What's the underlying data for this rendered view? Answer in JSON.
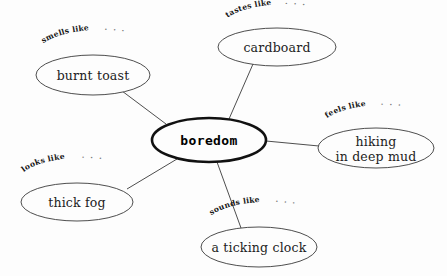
{
  "diagram": {
    "type": "sensory-detail-web",
    "background_color": "#fdfdfd",
    "ink_color": "#3a3a3a",
    "central_node": {
      "label": "boredom",
      "cx": 209,
      "cy": 140,
      "rx": 57,
      "ry": 22,
      "emphasis": "bold-outline"
    },
    "branches": [
      {
        "id": "smells",
        "category": "smells like",
        "ellipsis": ". . .",
        "label": "burnt toast",
        "lines": [
          "burnt toast"
        ],
        "cx": 93,
        "cy": 75,
        "rx": 57,
        "ry": 20,
        "edge": {
          "x1": 122,
          "y1": 91,
          "x2": 166,
          "y2": 124
        },
        "arc": {
          "x": 36,
          "y": 50,
          "sweep": "up",
          "rx": 66,
          "ry": 26
        }
      },
      {
        "id": "tastes",
        "category": "tastes like",
        "ellipsis": ". . .",
        "label": "cardboard",
        "lines": [
          "cardboard"
        ],
        "cx": 277,
        "cy": 47,
        "rx": 59,
        "ry": 19,
        "edge": {
          "x1": 253,
          "y1": 64,
          "x2": 229,
          "y2": 119
        },
        "arc": {
          "x": 220,
          "y": 23,
          "sweep": "up",
          "rx": 66,
          "ry": 26
        }
      },
      {
        "id": "feels",
        "category": "feels like",
        "ellipsis": ". . .",
        "label": "hiking in deep mud",
        "lines": [
          "hiking",
          "in deep mud"
        ],
        "cx": 376,
        "cy": 148,
        "rx": 58,
        "ry": 20,
        "edge": {
          "x1": 266,
          "y1": 141,
          "x2": 319,
          "y2": 146
        },
        "arc": {
          "x": 322,
          "y": 124,
          "sweep": "up",
          "rx": 64,
          "ry": 24
        }
      },
      {
        "id": "sounds",
        "category": "sounds like",
        "ellipsis": ". . .",
        "label": "a ticking clock",
        "lines": [
          "a ticking clock"
        ],
        "cx": 259,
        "cy": 247,
        "rx": 58,
        "ry": 20,
        "edge": {
          "x1": 217,
          "y1": 162,
          "x2": 241,
          "y2": 228
        },
        "arc": {
          "x": 204,
          "y": 222,
          "sweep": "up",
          "rx": 66,
          "ry": 26
        }
      },
      {
        "id": "looks",
        "category": "looks like",
        "ellipsis": ". . .",
        "label": "thick fog",
        "lines": [
          "thick fog"
        ],
        "cx": 77,
        "cy": 202,
        "rx": 56,
        "ry": 19,
        "edge": {
          "x1": 127,
          "y1": 189,
          "x2": 177,
          "y2": 159
        },
        "arc": {
          "x": 20,
          "y": 177,
          "sweep": "up",
          "rx": 64,
          "ry": 24
        }
      }
    ]
  }
}
